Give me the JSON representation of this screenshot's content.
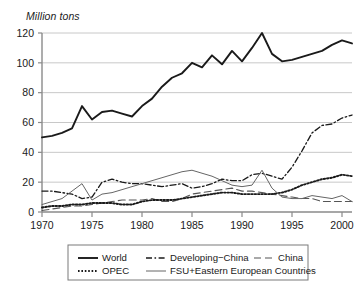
{
  "axis_title": "Million tons",
  "legend": {
    "entries": [
      {
        "label": "World",
        "style": "solid-thick",
        "color": "#1a1a1a"
      },
      {
        "label": "Developing−China",
        "style": "dash-dot",
        "color": "#1a1a1a"
      },
      {
        "label": "China",
        "style": "long-dash",
        "color": "#555555"
      },
      {
        "label": "OPEC",
        "style": "dotted",
        "color": "#1a1a1a"
      },
      {
        "label": "FSU+Eastern European Countries",
        "style": "solid-thin",
        "color": "#666666"
      }
    ]
  },
  "chart_data": {
    "type": "line",
    "title": "",
    "xlabel": "",
    "ylabel": "Million tons",
    "xlim": [
      1970,
      2001
    ],
    "ylim": [
      0,
      120
    ],
    "yticks": [
      0,
      20,
      40,
      60,
      80,
      100,
      120
    ],
    "xticks": [
      1970,
      1975,
      1980,
      1985,
      1990,
      1995,
      2000
    ],
    "ytick_labels": [
      "0",
      "20",
      "40",
      "60",
      "80",
      "100",
      "120"
    ],
    "xtick_labels": [
      "1970",
      "1975",
      "1980",
      "1985",
      "1990",
      "1995",
      "2000"
    ],
    "grid": "horizontal",
    "legend_position": "below",
    "x": [
      1970,
      1971,
      1972,
      1973,
      1974,
      1975,
      1976,
      1977,
      1978,
      1979,
      1980,
      1981,
      1982,
      1983,
      1984,
      1985,
      1986,
      1987,
      1988,
      1989,
      1990,
      1991,
      1992,
      1993,
      1994,
      1995,
      1996,
      1997,
      1998,
      1999,
      2000,
      2001
    ],
    "series": [
      {
        "name": "World",
        "style": "solid-thick",
        "color": "#1a1a1a",
        "values": [
          50,
          51,
          53,
          56,
          71,
          62,
          67,
          68,
          66,
          64,
          71,
          76,
          84,
          90,
          93,
          100,
          97,
          105,
          99,
          108,
          101,
          110,
          120,
          106,
          101,
          102,
          104,
          106,
          108,
          112,
          115,
          113
        ]
      },
      {
        "name": "Developing−China",
        "style": "dash-dot",
        "color": "#1a1a1a",
        "values": [
          14,
          14,
          13,
          12,
          9,
          10,
          20,
          22,
          20,
          19,
          19,
          18,
          17,
          18,
          19,
          16,
          17,
          19,
          22,
          21,
          21,
          25,
          26,
          24,
          22,
          30,
          41,
          53,
          58,
          59,
          63,
          65
        ]
      },
      {
        "name": "China",
        "style": "long-dash",
        "color": "#555555",
        "values": [
          1,
          2,
          3,
          4,
          4,
          5,
          6,
          7,
          8,
          8,
          8,
          9,
          7,
          7,
          9,
          12,
          13,
          14,
          15,
          16,
          14,
          14,
          13,
          12,
          11,
          10,
          9,
          9,
          7,
          7,
          7,
          7
        ]
      },
      {
        "name": "OPEC",
        "style": "dotted",
        "color": "#1a1a1a",
        "values": [
          3,
          4,
          4,
          5,
          5,
          6,
          6,
          6,
          5,
          5,
          7,
          8,
          8,
          8,
          9,
          10,
          11,
          12,
          13,
          13,
          12,
          12,
          12,
          12,
          13,
          15,
          18,
          20,
          22,
          23,
          25,
          24
        ]
      },
      {
        "name": "FSU+Eastern European Countries",
        "style": "solid-thin",
        "color": "#666666",
        "values": [
          5,
          7,
          9,
          14,
          19,
          8,
          12,
          13,
          15,
          17,
          19,
          21,
          23,
          25,
          27,
          28,
          26,
          24,
          21,
          18,
          17,
          18,
          28,
          16,
          10,
          9,
          9,
          11,
          10,
          9,
          11,
          7
        ]
      }
    ]
  }
}
